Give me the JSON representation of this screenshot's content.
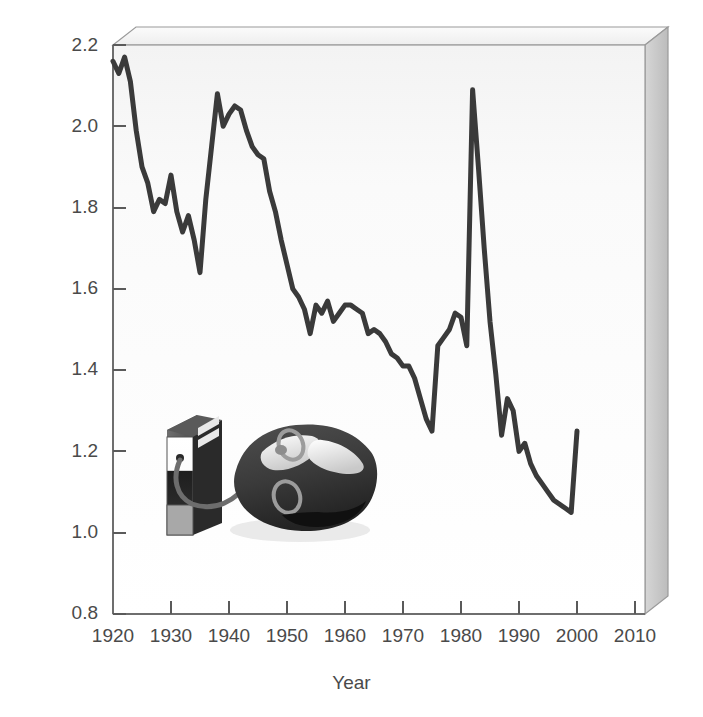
{
  "chart_data": {
    "type": "line",
    "title": "",
    "xlabel": "Year",
    "ylabel": "Dollars per gallon (in 1993 dollars)",
    "xlim": [
      1920,
      2010
    ],
    "ylim": [
      0.8,
      2.2
    ],
    "xticks": [
      "1920",
      "1930",
      "1940",
      "1950",
      "1960",
      "1970",
      "1980",
      "1990",
      "2000",
      "2010"
    ],
    "yticks": [
      "0.8",
      "1.0",
      "1.2",
      "1.4",
      "1.6",
      "1.8",
      "2.0",
      "2.2"
    ],
    "grid": false,
    "legend": "none",
    "style_3d": true,
    "line_color": "#3a3a3a",
    "series": [
      {
        "name": "Gasoline price",
        "x": [
          1920,
          1921,
          1922,
          1923,
          1924,
          1925,
          1926,
          1927,
          1928,
          1929,
          1930,
          1931,
          1932,
          1933,
          1934,
          1935,
          1936,
          1937,
          1938,
          1939,
          1940,
          1941,
          1942,
          1943,
          1944,
          1945,
          1946,
          1947,
          1948,
          1949,
          1950,
          1951,
          1952,
          1953,
          1954,
          1955,
          1956,
          1957,
          1958,
          1959,
          1960,
          1961,
          1962,
          1963,
          1964,
          1965,
          1966,
          1967,
          1968,
          1969,
          1970,
          1971,
          1972,
          1973,
          1974,
          1975,
          1976,
          1977,
          1978,
          1979,
          1980,
          1981,
          1982,
          1983,
          1984,
          1985,
          1986,
          1987,
          1988,
          1989,
          1990,
          1991,
          1992,
          1993,
          1994,
          1995,
          1996,
          1997,
          1998,
          1999,
          2000
        ],
        "y": [
          2.16,
          2.13,
          2.17,
          2.11,
          1.99,
          1.9,
          1.86,
          1.79,
          1.82,
          1.81,
          1.88,
          1.79,
          1.74,
          1.78,
          1.72,
          1.64,
          1.82,
          1.95,
          2.08,
          2.0,
          2.03,
          2.05,
          2.04,
          1.99,
          1.95,
          1.93,
          1.92,
          1.84,
          1.79,
          1.72,
          1.66,
          1.6,
          1.58,
          1.55,
          1.49,
          1.56,
          1.54,
          1.57,
          1.52,
          1.54,
          1.56,
          1.56,
          1.55,
          1.54,
          1.49,
          1.5,
          1.49,
          1.47,
          1.44,
          1.43,
          1.41,
          1.41,
          1.38,
          1.33,
          1.28,
          1.25,
          1.46,
          1.48,
          1.5,
          1.54,
          1.53,
          1.46,
          2.09,
          1.9,
          1.7,
          1.52,
          1.39,
          1.24,
          1.33,
          1.3,
          1.2,
          1.22,
          1.17,
          1.14,
          1.12,
          1.1,
          1.08,
          1.07,
          1.06,
          1.05,
          1.25
        ]
      }
    ]
  },
  "illustration": {
    "pump_label": "gas-pump",
    "car_label": "car",
    "hose_label": "fuel-hose"
  }
}
